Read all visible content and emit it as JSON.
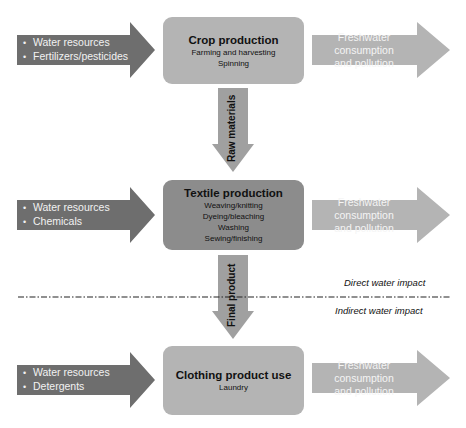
{
  "colors": {
    "input_arrow": "#6e6e6e",
    "output_arrow": "#b4b4b4",
    "box_light": "#b4b4b4",
    "box_dark": "#8c8c8c",
    "vertical_arrow": "#a0a0a0",
    "text_dark": "#111111",
    "text_light": "#f2f2f2"
  },
  "stages": [
    {
      "title": "Crop production",
      "details": [
        "Farming and harvesting",
        "Spinning"
      ],
      "inputs": [
        "Water resources",
        "Fertilizers/pesticides"
      ],
      "output": [
        "Freshwater consumption",
        "and pollution"
      ]
    },
    {
      "title": "Textile production",
      "details": [
        "Weaving/knitting",
        "Dyeing/bleaching",
        "Washing",
        "Sewing/finishing"
      ],
      "inputs": [
        "Water resources",
        "Chemicals"
      ],
      "output": [
        "Freshwater consumption",
        "and pollution"
      ]
    },
    {
      "title": "Clothing product use",
      "details": [
        "Laundry"
      ],
      "inputs": [
        "Water resources",
        "Detergents"
      ],
      "output": [
        "Freshwater consumption",
        "and pollution"
      ]
    }
  ],
  "flows": [
    {
      "label": "Raw materials"
    },
    {
      "label": "Final product"
    }
  ],
  "divider": {
    "above_label": "Direct water impact",
    "below_label": "Indirect water impact"
  }
}
